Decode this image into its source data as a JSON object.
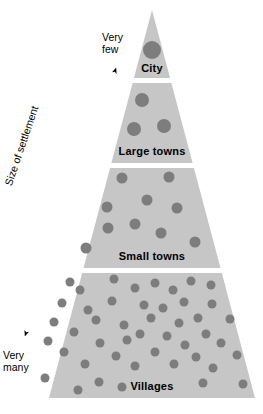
{
  "diagram": {
    "type": "settlement-hierarchy-pyramid",
    "axis": {
      "title": "Size of settlement",
      "top_label": "Very\nfew",
      "top_label_line1": "Very",
      "top_label_line2": "few",
      "bottom_label_line1": "Very",
      "bottom_label_line2": "many",
      "arrow_style": "double-headed",
      "arrow_color": "#000000"
    },
    "colors": {
      "pyramid_fill": "#c6c6c6",
      "dot_fill": "#7d7d7d",
      "separator": "#ffffff",
      "text": "#000000",
      "background": "#ffffff"
    },
    "geometry": {
      "apex_x": 152,
      "apex_y": 10,
      "base_left_x": 23,
      "base_right_x": 255,
      "base_y": 398,
      "band_boundaries_y": [
        10,
        78,
        163,
        268,
        398
      ],
      "separator_gap_px": 5
    },
    "tiers": [
      {
        "label": "City",
        "rank": 1,
        "count_description": "Very few",
        "dot_count": 1,
        "dot_radius": 9,
        "top_y": 10,
        "bottom_y": 78,
        "label_y": 63,
        "dots": [
          {
            "x": 152,
            "y": 50,
            "r": 9
          }
        ]
      },
      {
        "label": "Large towns",
        "rank": 2,
        "dot_count": 3,
        "dot_radius": 7,
        "top_y": 83,
        "bottom_y": 163,
        "label_y": 146,
        "dots": [
          {
            "x": 142,
            "y": 100,
            "r": 7
          },
          {
            "x": 134,
            "y": 129,
            "r": 7
          },
          {
            "x": 164,
            "y": 126,
            "r": 7
          }
        ]
      },
      {
        "label": "Small towns",
        "rank": 3,
        "dot_count": 10,
        "dot_radius": 5.5,
        "top_y": 168,
        "bottom_y": 268,
        "label_y": 251,
        "dots": [
          {
            "x": 122,
            "y": 178,
            "r": 5.5
          },
          {
            "x": 169,
            "y": 177,
            "r": 5.5
          },
          {
            "x": 147,
            "y": 200,
            "r": 5.5
          },
          {
            "x": 107,
            "y": 207,
            "r": 5.5
          },
          {
            "x": 177,
            "y": 208,
            "r": 5.5
          },
          {
            "x": 135,
            "y": 224,
            "r": 5.5
          },
          {
            "x": 108,
            "y": 228,
            "r": 5.5
          },
          {
            "x": 161,
            "y": 233,
            "r": 5.5
          },
          {
            "x": 195,
            "y": 242,
            "r": 5.5
          },
          {
            "x": 86,
            "y": 248,
            "r": 5.5
          }
        ]
      },
      {
        "label": "Villages",
        "rank": 4,
        "count_description": "Very many",
        "dot_count": 46,
        "dot_radius": 4.5,
        "top_y": 273,
        "bottom_y": 398,
        "label_y": 381,
        "dots": [
          {
            "x": 70,
            "y": 282,
            "r": 4.5
          },
          {
            "x": 114,
            "y": 279,
            "r": 4.5
          },
          {
            "x": 155,
            "y": 283,
            "r": 4.5
          },
          {
            "x": 191,
            "y": 281,
            "r": 4.5
          },
          {
            "x": 211,
            "y": 285,
            "r": 4.5
          },
          {
            "x": 80,
            "y": 290,
            "r": 4.5
          },
          {
            "x": 135,
            "y": 288,
            "r": 4.5
          },
          {
            "x": 173,
            "y": 290,
            "r": 4.5
          },
          {
            "x": 62,
            "y": 303,
            "r": 4.5
          },
          {
            "x": 112,
            "y": 301,
            "r": 4.5
          },
          {
            "x": 144,
            "y": 305,
            "r": 4.5
          },
          {
            "x": 184,
            "y": 302,
            "r": 4.5
          },
          {
            "x": 212,
            "y": 304,
            "r": 4.5
          },
          {
            "x": 88,
            "y": 310,
            "r": 4.5
          },
          {
            "x": 163,
            "y": 308,
            "r": 4.5
          },
          {
            "x": 54,
            "y": 322,
            "r": 4.5
          },
          {
            "x": 96,
            "y": 320,
            "r": 4.5
          },
          {
            "x": 124,
            "y": 325,
            "r": 4.5
          },
          {
            "x": 151,
            "y": 318,
            "r": 4.5
          },
          {
            "x": 179,
            "y": 323,
            "r": 4.5
          },
          {
            "x": 198,
            "y": 318,
            "r": 4.5
          },
          {
            "x": 230,
            "y": 319,
            "r": 4.5
          },
          {
            "x": 74,
            "y": 332,
            "r": 4.5
          },
          {
            "x": 140,
            "y": 334,
            "r": 4.5
          },
          {
            "x": 167,
            "y": 336,
            "r": 4.5
          },
          {
            "x": 206,
            "y": 334,
            "r": 4.5
          },
          {
            "x": 48,
            "y": 341,
            "r": 4.5
          },
          {
            "x": 100,
            "y": 343,
            "r": 4.5
          },
          {
            "x": 127,
            "y": 340,
            "r": 4.5
          },
          {
            "x": 185,
            "y": 345,
            "r": 4.5
          },
          {
            "x": 221,
            "y": 343,
            "r": 4.5
          },
          {
            "x": 64,
            "y": 352,
            "r": 4.5
          },
          {
            "x": 116,
            "y": 356,
            "r": 4.5
          },
          {
            "x": 155,
            "y": 352,
            "r": 4.5
          },
          {
            "x": 196,
            "y": 357,
            "r": 4.5
          },
          {
            "x": 237,
            "y": 355,
            "r": 4.5
          },
          {
            "x": 85,
            "y": 364,
            "r": 4.5
          },
          {
            "x": 135,
            "y": 366,
            "r": 4.5
          },
          {
            "x": 174,
            "y": 364,
            "r": 4.5
          },
          {
            "x": 213,
            "y": 368,
            "r": 4.5
          },
          {
            "x": 45,
            "y": 378,
            "r": 4.5
          },
          {
            "x": 99,
            "y": 382,
            "r": 4.5
          },
          {
            "x": 78,
            "y": 390,
            "r": 4.5
          },
          {
            "x": 122,
            "y": 387,
            "r": 4.5
          },
          {
            "x": 203,
            "y": 383,
            "r": 4.5
          },
          {
            "x": 243,
            "y": 384,
            "r": 4.5
          }
        ]
      }
    ]
  }
}
